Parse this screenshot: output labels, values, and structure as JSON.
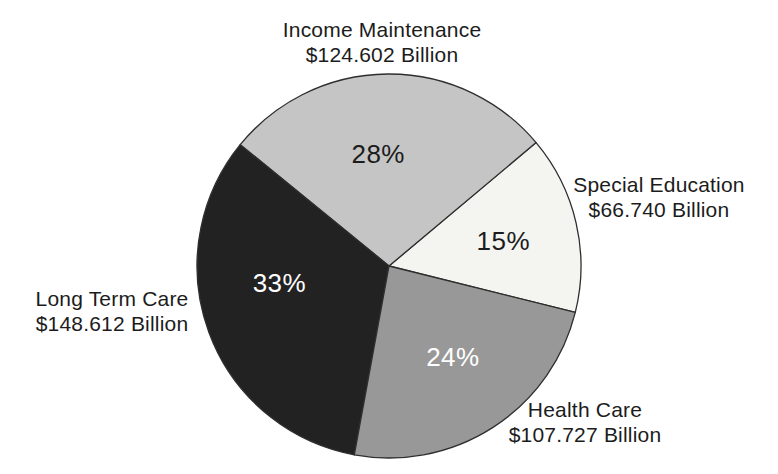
{
  "figure": {
    "background": "#ffffff",
    "text_color": "#1c1c1c"
  },
  "chart_data": {
    "type": "pie",
    "title": "",
    "legend": "none",
    "grid": false,
    "slices": [
      {
        "label": "Special Education",
        "amount": "$66.740 Billion",
        "value": 66.74,
        "pct": 15,
        "pct_label": "15%",
        "color": "#f4f4f1",
        "pct_text_color": "#1c1c1c"
      },
      {
        "label": "Income Maintenance",
        "amount": "$124.602 Billion",
        "value": 124.602,
        "pct": 28,
        "pct_label": "28%",
        "color": "#c5c5c5",
        "pct_text_color": "#1c1c1c"
      },
      {
        "label": "Long Term Care",
        "amount": "$148.612 Billion",
        "value": 148.612,
        "pct": 33,
        "pct_label": "33%",
        "color": "#222222",
        "pct_text_color": "#ffffff"
      },
      {
        "label": "Health Care",
        "amount": "$107.727 Billion",
        "value": 107.727,
        "pct": 24,
        "pct_label": "24%",
        "color": "#989898",
        "pct_text_color": "#ffffff"
      }
    ],
    "layout": {
      "center_x": 389,
      "center_y": 266,
      "radius": 192,
      "start_angle_deg": -14,
      "direction": "ccw",
      "stroke_color": "#2e2e2e",
      "stroke_width": 1.3,
      "pct_label_font_size": 26,
      "slice_label_hints": [
        {
          "angle": 12.5,
          "frac": 0.61
        },
        {
          "angle": 95.5,
          "frac": 0.585
        },
        {
          "angle": 189.0,
          "frac": 0.578
        },
        {
          "angle": 305.0,
          "frac": 0.58
        }
      ]
    }
  }
}
